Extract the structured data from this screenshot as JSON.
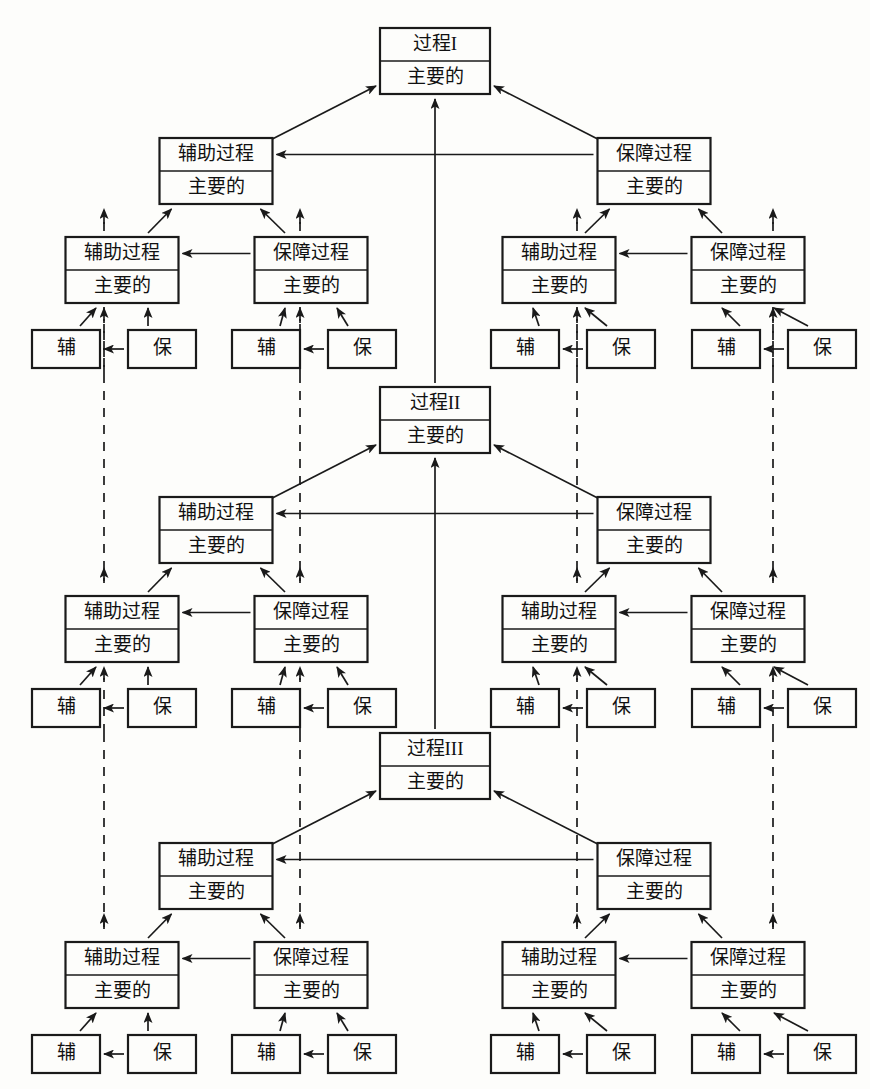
{
  "diagram": {
    "labels": {
      "process_1": "过程I",
      "process_2": "过程II",
      "process_3": "过程III",
      "auxiliary_process": "辅助过程",
      "support_process": "保障过程",
      "main": "主要的",
      "aux_short": "辅",
      "sup_short": "保"
    },
    "colors": {
      "stroke": "#1a1a1a",
      "box_fill": "#fdfdfb",
      "background": "#ffffff"
    },
    "legend": {
      "solid_edge": "实线箭头",
      "dashed_edge": "虚线箭头"
    },
    "tiers": [
      {
        "id": "tier-1",
        "root": {
          "name": "process-1",
          "top_label": "过程I",
          "bottom_label": "主要的"
        },
        "level2": [
          {
            "name": "aux-process-l",
            "top_label": "辅助过程",
            "bottom_label": "主要的"
          },
          {
            "name": "sup-process-r",
            "top_label": "保障过程",
            "bottom_label": "主要的"
          }
        ],
        "level3": [
          {
            "name": "aux-process",
            "top_label": "辅助过程",
            "bottom_label": "主要的"
          },
          {
            "name": "sup-process",
            "top_label": "保障过程",
            "bottom_label": "主要的"
          },
          {
            "name": "aux-process",
            "top_label": "辅助过程",
            "bottom_label": "主要的"
          },
          {
            "name": "sup-process",
            "top_label": "保障过程",
            "bottom_label": "主要的"
          }
        ],
        "leaves": [
          "辅",
          "保",
          "辅",
          "保",
          "辅",
          "保",
          "辅",
          "保"
        ]
      },
      {
        "id": "tier-2",
        "root": {
          "name": "process-2",
          "top_label": "过程II",
          "bottom_label": "主要的"
        },
        "level2": [
          {
            "name": "aux-process-l",
            "top_label": "辅助过程",
            "bottom_label": "主要的"
          },
          {
            "name": "sup-process-r",
            "top_label": "保障过程",
            "bottom_label": "主要的"
          }
        ],
        "level3": [
          {
            "name": "aux-process",
            "top_label": "辅助过程",
            "bottom_label": "主要的"
          },
          {
            "name": "sup-process",
            "top_label": "保障过程",
            "bottom_label": "主要的"
          },
          {
            "name": "aux-process",
            "top_label": "辅助过程",
            "bottom_label": "主要的"
          },
          {
            "name": "sup-process",
            "top_label": "保障过程",
            "bottom_label": "主要的"
          }
        ],
        "leaves": [
          "辅",
          "保",
          "辅",
          "保",
          "辅",
          "保",
          "辅",
          "保"
        ]
      },
      {
        "id": "tier-3",
        "root": {
          "name": "process-3",
          "top_label": "过程III",
          "bottom_label": "主要的"
        },
        "level2": [
          {
            "name": "aux-process-l",
            "top_label": "辅助过程",
            "bottom_label": "主要的"
          },
          {
            "name": "sup-process-r",
            "top_label": "保障过程",
            "bottom_label": "主要的"
          }
        ],
        "level3": [
          {
            "name": "aux-process",
            "top_label": "辅助过程",
            "bottom_label": "主要的"
          },
          {
            "name": "sup-process",
            "top_label": "保障过程",
            "bottom_label": "主要的"
          },
          {
            "name": "aux-process",
            "top_label": "辅助过程",
            "bottom_label": "主要的"
          },
          {
            "name": "sup-process",
            "top_label": "保障过程",
            "bottom_label": "主要的"
          }
        ],
        "leaves": [
          "辅",
          "保",
          "辅",
          "保",
          "辅",
          "保",
          "辅",
          "保"
        ]
      }
    ]
  }
}
